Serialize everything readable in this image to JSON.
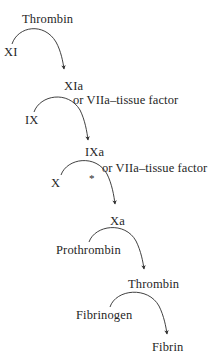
{
  "diagram": {
    "background_color": "#ffffff",
    "ink_color": "#262626",
    "width": 211,
    "height": 364,
    "steps": [
      {
        "id": "step-1",
        "substrate": "XI",
        "enzyme": "Thrombin",
        "product": "XIa",
        "cofactor": "",
        "marked": false
      },
      {
        "id": "step-2",
        "substrate": "IX",
        "enzyme": "XIa",
        "product": "IXa",
        "cofactor": "or VIIa–tissue factor",
        "marked": false
      },
      {
        "id": "step-3",
        "substrate": "X",
        "enzyme": "IXa",
        "product": "Xa",
        "cofactor": "or VIIa–tissue factor",
        "marked": true,
        "mark": "*"
      },
      {
        "id": "step-4",
        "substrate": "Prothrombin",
        "enzyme": "Xa",
        "product": "Thrombin",
        "cofactor": "",
        "marked": false
      },
      {
        "id": "step-5",
        "substrate": "Fibrinogen",
        "enzyme": "Thrombin",
        "product": "Fibrin",
        "cofactor": "",
        "marked": false
      }
    ],
    "labels": {
      "thrombin_top": "Thrombin",
      "xi": "XI",
      "xia": "XIa",
      "cofactor_1": "or VIIa–tissue factor",
      "ix": "IX",
      "ixa": "IXa",
      "cofactor_2": "or VIIa–tissue factor",
      "x": "X",
      "asterisk": "*",
      "xa": "Xa",
      "prothrombin": "Prothrombin",
      "thrombin_mid": "Thrombin",
      "fibrinogen": "Fibrinogen",
      "fibrin": "Fibrin"
    }
  }
}
